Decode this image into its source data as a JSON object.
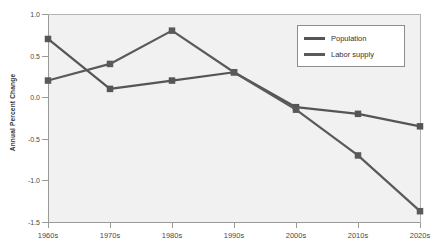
{
  "chart_data": {
    "type": "line",
    "title": "",
    "xlabel": "",
    "ylabel": "Annual Percent Change",
    "categories": [
      "1960s",
      "1970s",
      "1980s",
      "1990s",
      "2000s",
      "2010s",
      "2020s"
    ],
    "ylim": [
      -1.5,
      1.0
    ],
    "ytick_labels": [
      "1.0",
      "0.5",
      "0.0",
      "-0.5",
      "-1.0",
      "-1.5"
    ],
    "ytick_values": [
      1.0,
      0.5,
      0.0,
      -0.5,
      -1.0,
      -1.5
    ],
    "grid": false,
    "legend_position": "top-right",
    "series": [
      {
        "name": "Population",
        "values": [
          0.7,
          0.1,
          0.2,
          0.3,
          -0.12,
          -0.2,
          -0.35
        ],
        "color": "#555555",
        "marker": "square"
      },
      {
        "name": "Labor supply",
        "values": [
          0.2,
          0.4,
          0.8,
          0.3,
          -0.15,
          -0.7,
          -1.37
        ],
        "color": "#5a5a5a",
        "marker": "square"
      }
    ]
  },
  "legend": {
    "entries": [
      {
        "label": "Population",
        "color": "#555555"
      },
      {
        "label": "Labor supply",
        "color": "#5a5a5a"
      }
    ]
  },
  "axes": {
    "y_title": "Annual Percent Change"
  },
  "colors": {
    "plot_background": "#f1f1f1",
    "axis_line": "#9a9a9a",
    "series_gray": "#555555",
    "legend_border": "#8c8c8c",
    "text": "#3a3a3a"
  }
}
